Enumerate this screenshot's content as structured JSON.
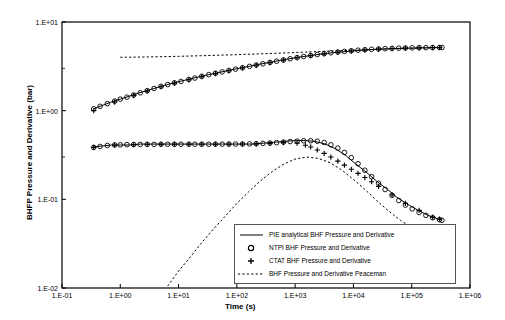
{
  "chart_data": {
    "type": "scatter",
    "title": "",
    "xlabel": "Time (s)",
    "ylabel": "BHFP Pressure and Derivative (bar)",
    "xscale": "log",
    "yscale": "log",
    "xlim": [
      0.1,
      1000000
    ],
    "ylim": [
      0.01,
      10
    ],
    "grid": false,
    "xticks": [
      "1.E-01",
      "1.E+00",
      "1.E+01",
      "1.E+02",
      "1.E+03",
      "1.E+04",
      "1.E+05",
      "1.E+06"
    ],
    "xtick_values": [
      0.1,
      1,
      10,
      100,
      1000,
      10000,
      100000,
      1000000
    ],
    "yticks": [
      "1.E-02",
      "1.E-01",
      "1.E+00",
      "1.E+01"
    ],
    "ytick_values": [
      0.01,
      0.1,
      1,
      10
    ],
    "legend_position": "lower-center-right",
    "legend": [
      {
        "key": "line",
        "label": "PIE analytical BHF Pressure and Derivative"
      },
      {
        "key": "circle",
        "label": "NTPI BHF Pressure and Derivative"
      },
      {
        "key": "plus",
        "label": "CTAT BHF Pressure and Derivative"
      },
      {
        "key": "dashed",
        "label": "BHF Pressure and Derivative Peaceman"
      }
    ],
    "series": [
      {
        "name": "PIE analytical BHF Pressure",
        "style": "solid-line",
        "x": [
          0.35,
          0.5,
          0.7,
          1.0,
          1.4,
          2.0,
          3.0,
          4.5,
          7.0,
          10,
          15,
          22,
          33,
          50,
          75,
          110,
          170,
          250,
          380,
          560,
          850,
          1300,
          1900,
          2900,
          4300,
          6500,
          9800,
          15000,
          22000,
          33000,
          50000,
          75000,
          110000,
          170000,
          250000,
          330000
        ],
        "y": [
          1.05,
          1.15,
          1.25,
          1.35,
          1.45,
          1.57,
          1.7,
          1.84,
          2.0,
          2.12,
          2.26,
          2.4,
          2.55,
          2.7,
          2.86,
          3.01,
          3.18,
          3.35,
          3.52,
          3.7,
          3.88,
          4.05,
          4.2,
          4.36,
          4.5,
          4.62,
          4.72,
          4.82,
          4.9,
          4.97,
          5.02,
          5.06,
          5.09,
          5.12,
          5.14,
          5.15
        ]
      },
      {
        "name": "PIE analytical BHF Derivative",
        "style": "solid-line",
        "x": [
          0.35,
          0.5,
          0.7,
          1.0,
          1.5,
          2.2,
          3.3,
          5.0,
          7.5,
          11,
          17,
          25,
          38,
          56,
          85,
          130,
          190,
          290,
          430,
          650,
          980,
          1500,
          2200,
          3300,
          5000,
          7500,
          11000,
          17000,
          25000,
          38000,
          56000,
          85000,
          130000,
          190000,
          280000,
          330000
        ],
        "y": [
          0.39,
          0.4,
          0.41,
          0.41,
          0.41,
          0.42,
          0.42,
          0.42,
          0.42,
          0.42,
          0.42,
          0.42,
          0.42,
          0.42,
          0.42,
          0.42,
          0.42,
          0.43,
          0.44,
          0.45,
          0.46,
          0.46,
          0.45,
          0.42,
          0.37,
          0.31,
          0.25,
          0.2,
          0.16,
          0.13,
          0.105,
          0.088,
          0.075,
          0.066,
          0.06,
          0.058
        ]
      },
      {
        "name": "NTPI BHF Pressure",
        "style": "circles",
        "x": [
          0.35,
          0.45,
          0.6,
          0.8,
          1.0,
          1.3,
          1.7,
          2.2,
          2.9,
          3.8,
          5.0,
          6.5,
          8.5,
          11,
          15,
          19,
          25,
          33,
          43,
          56,
          73,
          95,
          125,
          165,
          215,
          280,
          370,
          480,
          630,
          820,
          1080,
          1400,
          1850,
          2400,
          3150,
          4100,
          5400,
          7000,
          9200,
          12000,
          15700,
          20500,
          27000,
          35000,
          46000,
          60000,
          78000,
          102000,
          134000,
          175000,
          229000,
          300000,
          330000
        ],
        "y": [
          1.05,
          1.12,
          1.2,
          1.28,
          1.35,
          1.42,
          1.5,
          1.59,
          1.68,
          1.78,
          1.88,
          1.97,
          2.06,
          2.14,
          2.25,
          2.33,
          2.44,
          2.55,
          2.64,
          2.74,
          2.84,
          2.94,
          3.05,
          3.16,
          3.27,
          3.38,
          3.5,
          3.61,
          3.73,
          3.85,
          3.97,
          4.08,
          4.19,
          4.3,
          4.4,
          4.49,
          4.58,
          4.66,
          4.74,
          4.81,
          4.87,
          4.92,
          4.96,
          5.0,
          5.04,
          5.07,
          5.09,
          5.11,
          5.13,
          5.14,
          5.15,
          5.16,
          5.16
        ]
      },
      {
        "name": "NTPI BHF Derivative",
        "style": "circles",
        "x": [
          0.35,
          0.45,
          0.6,
          0.8,
          1.0,
          1.3,
          1.7,
          2.2,
          2.9,
          3.8,
          5.0,
          6.5,
          8.5,
          11,
          15,
          19,
          25,
          33,
          43,
          56,
          73,
          95,
          125,
          165,
          215,
          280,
          370,
          480,
          630,
          820,
          1080,
          1400,
          1850,
          2400,
          3150,
          4100,
          5400,
          7000,
          9200,
          12000,
          15700,
          20500,
          27000,
          35000,
          46000,
          60000,
          78000,
          102000,
          134000,
          175000,
          229000,
          300000,
          330000
        ],
        "y": [
          0.385,
          0.395,
          0.405,
          0.41,
          0.412,
          0.414,
          0.415,
          0.416,
          0.417,
          0.417,
          0.418,
          0.418,
          0.418,
          0.418,
          0.418,
          0.418,
          0.418,
          0.418,
          0.419,
          0.419,
          0.42,
          0.42,
          0.421,
          0.422,
          0.424,
          0.427,
          0.431,
          0.436,
          0.442,
          0.448,
          0.454,
          0.458,
          0.458,
          0.452,
          0.437,
          0.412,
          0.378,
          0.338,
          0.295,
          0.252,
          0.213,
          0.18,
          0.152,
          0.129,
          0.111,
          0.097,
          0.086,
          0.078,
          0.071,
          0.066,
          0.062,
          0.059,
          0.058
        ]
      },
      {
        "name": "CTAT BHF Pressure",
        "style": "plus",
        "x": [
          0.35,
          0.8,
          1.7,
          2.9,
          5.0,
          8.5,
          15,
          25,
          43,
          73,
          125,
          215,
          370,
          630,
          1080,
          1850,
          3150,
          5400,
          9200,
          15700,
          27000,
          46000,
          78000,
          134000,
          229000,
          300000
        ],
        "y": [
          1.0,
          1.25,
          1.48,
          1.66,
          1.86,
          2.04,
          2.23,
          2.42,
          2.62,
          2.82,
          3.03,
          3.25,
          3.48,
          3.71,
          3.95,
          4.17,
          4.37,
          4.55,
          4.7,
          4.84,
          4.94,
          5.02,
          5.08,
          5.12,
          5.15,
          5.16
        ]
      },
      {
        "name": "CTAT BHF Derivative",
        "style": "plus",
        "x": [
          0.35,
          0.8,
          1.7,
          2.9,
          5.0,
          8.5,
          15,
          25,
          43,
          73,
          125,
          215,
          370,
          630,
          1080,
          1500,
          1850,
          2400,
          3150,
          4100,
          5400,
          7000,
          9200,
          12000,
          15700,
          20500,
          27000,
          46000,
          78000,
          134000,
          229000,
          300000
        ],
        "y": [
          0.385,
          0.408,
          0.414,
          0.416,
          0.417,
          0.418,
          0.418,
          0.418,
          0.418,
          0.418,
          0.42,
          0.422,
          0.428,
          0.436,
          0.43,
          0.408,
          0.39,
          0.36,
          0.33,
          0.3,
          0.27,
          0.243,
          0.218,
          0.196,
          0.176,
          0.158,
          0.14,
          0.112,
          0.09,
          0.075,
          0.063,
          0.06
        ]
      },
      {
        "name": "BHF Pressure Peaceman",
        "style": "dashed",
        "x": [
          1.0,
          2,
          5,
          10,
          30,
          100,
          400,
          1500,
          6000,
          25000,
          100000,
          330000
        ],
        "y": [
          4.0,
          4.02,
          4.06,
          4.1,
          4.18,
          4.28,
          4.42,
          4.58,
          4.75,
          4.92,
          5.05,
          5.13
        ]
      },
      {
        "name": "BHF Derivative Peaceman",
        "style": "dashed",
        "x": [
          6.5,
          10,
          16,
          25,
          40,
          64,
          100,
          160,
          250,
          400,
          640,
          1000,
          1600,
          2500,
          4000,
          6400,
          10000,
          16000,
          25000,
          40000,
          64000,
          100000,
          160000,
          250000,
          330000
        ],
        "y": [
          0.0105,
          0.0155,
          0.0225,
          0.0325,
          0.0465,
          0.065,
          0.09,
          0.122,
          0.16,
          0.205,
          0.25,
          0.285,
          0.3,
          0.29,
          0.258,
          0.213,
          0.168,
          0.128,
          0.097,
          0.074,
          0.058,
          0.048,
          0.04,
          0.035,
          0.033
        ]
      }
    ]
  }
}
